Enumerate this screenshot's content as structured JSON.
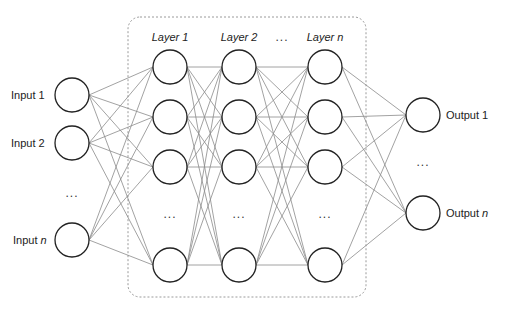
{
  "diagram": {
    "inputs": [
      {
        "label": "Input 1",
        "y": 95
      },
      {
        "label": "Input 2",
        "y": 143
      },
      {
        "label": "Input",
        "italic_suffix": "n",
        "y": 240
      }
    ],
    "inputs_ellipsis": {
      "text": "...",
      "y": 194
    },
    "hidden_layers": [
      {
        "label": "Layer 1",
        "x": 170
      },
      {
        "label": "Layer 2",
        "x": 239
      },
      {
        "label": "Layer n",
        "x": 325
      }
    ],
    "layers_ellipsis": {
      "text": "...",
      "x": 282
    },
    "hidden_rows_y": [
      67,
      117,
      167,
      265
    ],
    "hidden_row_ellipsis_y": 215,
    "outputs": [
      {
        "label": "Output 1",
        "y": 115
      },
      {
        "label": "Output",
        "italic_suffix": "n",
        "y": 213
      }
    ],
    "outputs_ellipsis": {
      "text": "...",
      "y": 163
    },
    "input_x": 72,
    "output_x": 423,
    "node_radius": 17,
    "hidden_box": {
      "x": 128,
      "y": 17,
      "width": 238,
      "height": 280,
      "radius": 12
    },
    "colors": {
      "node_stroke": "#222222",
      "edge": "#8a8a8a",
      "box": "#9a9a9a",
      "text": "#222222"
    }
  }
}
